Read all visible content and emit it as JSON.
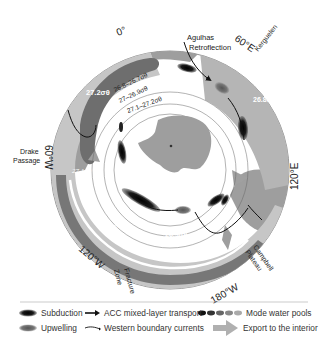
{
  "diagram": {
    "longitude_labels": {
      "deg0": "0°",
      "deg60E": "60°E",
      "deg120E": "120°E",
      "deg180W": "180°W",
      "deg120W": "120°W",
      "deg60W": "60°W"
    },
    "place_labels": {
      "agulhas_1": "Agulhas",
      "agulhas_2": "Retroflection",
      "kerguelen": "Kerguelen",
      "drake_1": "Drake",
      "drake_2": "Passage",
      "campbell_1": "Campbell",
      "campbell_2": "Plateau",
      "fracture_1": "Fracture",
      "fracture_2": "Zone"
    },
    "density_labels": {
      "d272": "27.2σθ",
      "d268_267": "26.8–26.7σθ",
      "d27_269": "27–26.9σθ",
      "d271_272": "27.1–27.2σθ",
      "d268": "26.8σθ",
      "d271": "27.1σθ",
      "d27": "27σθ",
      "d269": "26.9σθ"
    },
    "colors": {
      "land": "#9e9e9e",
      "upwelling_light": "#c4c4c4",
      "export_band": "#a8a8a8",
      "dark_band": "#6e6e6e",
      "subduction": "#111111",
      "outline": "#555555"
    }
  },
  "legend": {
    "subduction": "Subduction",
    "upwelling": "Upwelling",
    "acc_transport": "ACC mixed-layer transport",
    "western_boundary": "Western boundary currents",
    "mode_water": "Mode water pools",
    "export": "Export to the interior"
  }
}
